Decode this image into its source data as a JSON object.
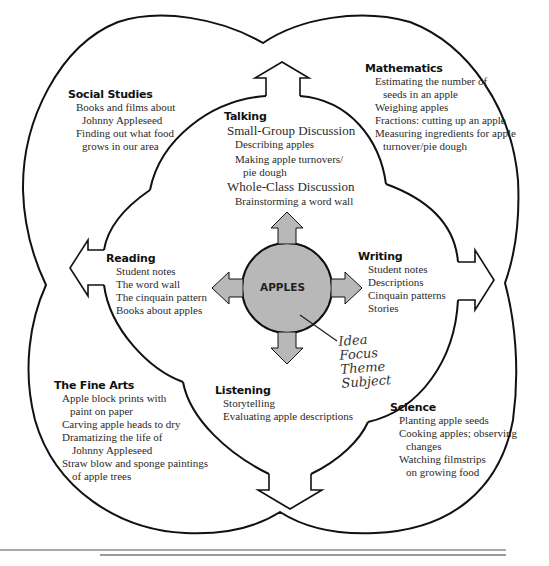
{
  "diagram": {
    "type": "web",
    "center": {
      "label": "APPLES",
      "fill": "#b8b8b8"
    },
    "annotation": [
      "Idea",
      "Focus",
      "Theme",
      "Subject"
    ],
    "colors": {
      "stroke": "#111111",
      "hub_fill": "#b8b8b8",
      "background": "#ffffff",
      "rule": "#555555",
      "rule_light": "#9a9a9a"
    },
    "inner": [
      {
        "key": "talking",
        "heading": "Talking",
        "items": [
          {
            "text": "Small-Group Discussion",
            "level": "sub"
          },
          {
            "text": "Describing apples",
            "level": "item"
          },
          {
            "text": "Making apple turnovers/",
            "level": "item"
          },
          {
            "text": "pie dough",
            "level": "cont"
          },
          {
            "text": "Whole-Class Discussion",
            "level": "sub"
          },
          {
            "text": "Brainstorming a word wall",
            "level": "item"
          }
        ]
      },
      {
        "key": "reading",
        "heading": "Reading",
        "items": [
          "Student notes",
          "The word wall",
          "The cinquain pattern",
          "Books about apples"
        ]
      },
      {
        "key": "writing",
        "heading": "Writing",
        "items": [
          "Student notes",
          "Descriptions",
          "Cinquain patterns",
          "Stories"
        ]
      },
      {
        "key": "listening",
        "heading": "Listening",
        "items": [
          "Storytelling",
          "Evaluating apple descriptions"
        ]
      }
    ],
    "outer": [
      {
        "key": "social-studies",
        "heading": "Social Studies",
        "items": [
          "Books and films about",
          "Johnny Appleseed",
          "Finding out what food",
          "grows in our area"
        ]
      },
      {
        "key": "mathematics",
        "heading": "Mathematics",
        "items": [
          "Estimating the number of",
          "seeds in an apple",
          "Weighing apples",
          "Fractions: cutting up an apple",
          "Measuring ingredients for apple",
          "turnover/pie dough"
        ]
      },
      {
        "key": "fine-arts",
        "heading": "The Fine Arts",
        "items": [
          "Apple block prints with",
          "paint on paper",
          "Carving apple heads to dry",
          "Dramatizing the life of",
          "Johnny Appleseed",
          "Straw blow and sponge paintings",
          "of apple trees"
        ]
      },
      {
        "key": "science",
        "heading": "Science",
        "items": [
          "Planting apple seeds",
          "Cooking apples; observing",
          "changes",
          "Watching filmstrips",
          "on growing food"
        ]
      }
    ]
  }
}
